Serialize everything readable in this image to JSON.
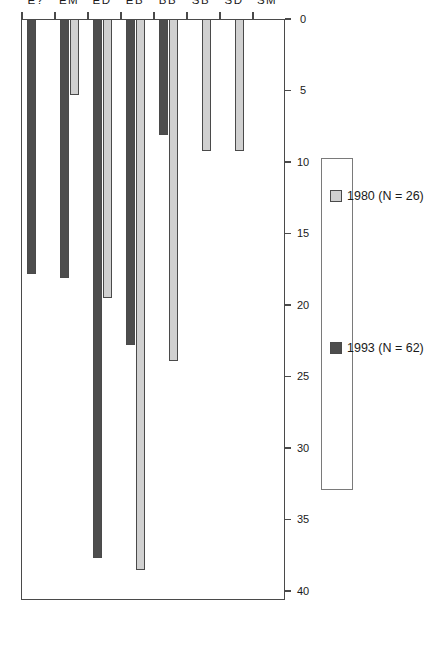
{
  "chart_data": {
    "type": "bar",
    "title": "",
    "xlabel": "",
    "ylabel": "%",
    "ylim": [
      0,
      40
    ],
    "orientation": "horizontal-rotated",
    "grid": false,
    "legend_position": "right",
    "categories": [
      "SM",
      "SD",
      "SB",
      "BB",
      "EB",
      "ED",
      "EM",
      "E?"
    ],
    "tick_labels": [
      "0",
      "5",
      "10",
      "15",
      "20",
      "25",
      "30",
      "35",
      "40"
    ],
    "tick_values": [
      0,
      5,
      10,
      15,
      20,
      25,
      30,
      35,
      40
    ],
    "series": [
      {
        "name": "1980 (N = 26)",
        "color": "#d0d0d0",
        "values": [
          0,
          9.2,
          9.2,
          23.9,
          38.5,
          19.5,
          5.3,
          0
        ]
      },
      {
        "name": "1993 (N = 62)",
        "color": "#4d4d4d",
        "values": [
          0,
          0,
          0,
          8.1,
          22.8,
          37.7,
          18.1,
          17.8
        ]
      }
    ]
  },
  "legend": {
    "entries": [
      {
        "label": "1980 (N = 26)",
        "swatch": "#d0d0d0"
      },
      {
        "label": "1993 (N = 62)",
        "swatch": "#4d4d4d"
      }
    ]
  },
  "axis": {
    "value_axis_title": "%"
  }
}
